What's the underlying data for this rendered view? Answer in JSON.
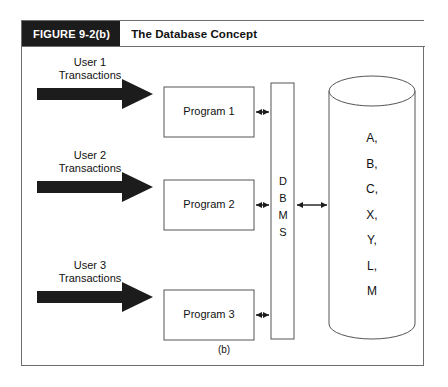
{
  "figure": {
    "number_label": "FIGURE 9-2(b)",
    "title": "The Database Concept",
    "panel_caption": "(b)",
    "colors": {
      "number_block_bg": "#1c1c1c",
      "number_block_text": "#ffffff",
      "frame_border": "#6e6e6e",
      "shape_outline": "#555555",
      "arrow_fill": "#1c1c1c",
      "background": "#ffffff"
    }
  },
  "diagram": {
    "type": "block-diagram",
    "users": [
      {
        "line1": "User 1",
        "line2": "Transactions"
      },
      {
        "line1": "User 2",
        "line2": "Transactions"
      },
      {
        "line1": "User 3",
        "line2": "Transactions"
      }
    ],
    "programs": [
      {
        "label": "Program 1"
      },
      {
        "label": "Program 2"
      },
      {
        "label": "Program 3"
      }
    ],
    "dbms": {
      "letters": [
        "D",
        "B",
        "M",
        "S"
      ],
      "expanded": "DBMS"
    },
    "database": {
      "shape": "cylinder",
      "contents": [
        "A,",
        "B,",
        "C,",
        "X,",
        "Y,",
        "L,",
        "M"
      ]
    },
    "connectors": {
      "user_to_program": "thick-right-arrow",
      "program_to_dbms": "double-headed-arrow",
      "dbms_to_database": "double-headed-arrow"
    }
  }
}
